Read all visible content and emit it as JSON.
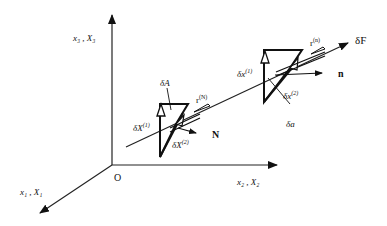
{
  "figure": {
    "type": "3D vector diagram",
    "axes": {
      "x1": {
        "label": "x₁ , X₁"
      },
      "x2": {
        "label": "x₂ , X₂"
      },
      "x3": {
        "label": "x₃ , X₃"
      },
      "origin": {
        "label": "O"
      }
    },
    "reference_config": {
      "area_label": "δA",
      "dX1_label": "δX",
      "dX1_sup": "(1)",
      "dX2_label": "δX",
      "dX2_sup": "(2)",
      "traction_label": "r",
      "traction_sup": "(N)",
      "normal_label": "N"
    },
    "current_config": {
      "area_label": "δa",
      "dx1_label": "δx",
      "dx1_sup": "(1)",
      "dx2_label": "δx",
      "dx2_sup": "(2)",
      "traction_label": "r",
      "traction_sup": "(n)",
      "normal_label": "n"
    },
    "force_label": "δF"
  }
}
